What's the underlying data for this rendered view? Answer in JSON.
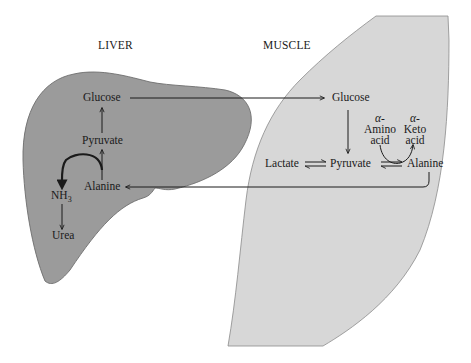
{
  "titles": {
    "liver": "LIVER",
    "muscle": "MUSCLE"
  },
  "liver": {
    "glucose": "Glucose",
    "pyruvate": "Pyruvate",
    "alanine": "Alanine",
    "nh3_main": "NH",
    "nh3_sub": "3",
    "urea": "Urea"
  },
  "muscle": {
    "glucose": "Glucose",
    "lactate": "Lactate",
    "pyruvate": "Pyruvate",
    "alanine": "Alanine",
    "amino_acid": {
      "greek": "α-",
      "line1": "Amino",
      "line2": "acid"
    },
    "keto_acid": {
      "greek": "α-",
      "line1": "Keto",
      "line2": "acid"
    }
  },
  "colors": {
    "liver_fill": "#9b9b9b",
    "muscle_fill": "#d7d7d7",
    "outline": "#6e6e6e",
    "arrow": "#1a1a1a",
    "background": "#ffffff"
  },
  "flows": [
    {
      "from": "liver.glucose",
      "to": "muscle.glucose",
      "type": "transport"
    },
    {
      "from": "muscle.glucose",
      "to": "muscle.pyruvate",
      "type": "reaction"
    },
    {
      "from": "muscle.lactate",
      "to": "muscle.pyruvate",
      "type": "equilibrium"
    },
    {
      "from": "muscle.pyruvate",
      "to": "muscle.alanine",
      "type": "equilibrium",
      "coupled": "α-Amino acid → α-Keto acid"
    },
    {
      "from": "muscle.alanine",
      "to": "liver.alanine",
      "type": "transport"
    },
    {
      "from": "liver.alanine",
      "to": "liver.pyruvate",
      "type": "reaction",
      "coupled": "NH3 release"
    },
    {
      "from": "liver.pyruvate",
      "to": "liver.glucose",
      "type": "reaction"
    },
    {
      "from": "liver.nh3",
      "to": "liver.urea",
      "type": "reaction"
    }
  ]
}
